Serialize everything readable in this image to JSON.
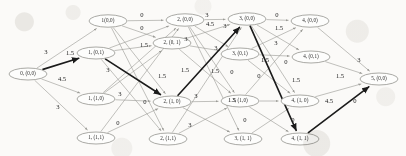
{
  "figure": {
    "kind": "layered-trellis-graph",
    "colors": {
      "background": "#fbfaf8",
      "node_fill": "#fdfdfc",
      "node_stroke": "#8d8d88",
      "edge": "#9a9a95",
      "highlight_edge": "#1b1b1b",
      "label_text": "#2b2b2b",
      "weight_text": "#242424"
    },
    "weight_values": [
      "0",
      "1.5",
      "3",
      "4.5"
    ]
  },
  "nodes": [
    {
      "id": "n0",
      "label": "0, (0,0)",
      "x": 28,
      "y": 74,
      "rx": 19,
      "ry": 6.0,
      "stage": 0,
      "state": "(0,0)"
    },
    {
      "id": "n1a",
      "label": "1(0,0)",
      "x": 108,
      "y": 21,
      "rx": 19,
      "ry": 6.2,
      "stage": 1,
      "state": "(0,0)"
    },
    {
      "id": "n1b",
      "label": "1, (0,1)",
      "x": 96,
      "y": 53,
      "rx": 19,
      "ry": 6.0,
      "stage": 1,
      "state": "(0,1)"
    },
    {
      "id": "n1c",
      "label": "1, (1,0)",
      "x": 96,
      "y": 99,
      "rx": 19,
      "ry": 6.0,
      "stage": 1,
      "state": "(1,0)"
    },
    {
      "id": "n1d",
      "label": "1, (1,1)",
      "x": 96,
      "y": 138,
      "rx": 19,
      "ry": 6.0,
      "stage": 1,
      "state": "(1,1)"
    },
    {
      "id": "n2a",
      "label": "2, (0,0)",
      "x": 185,
      "y": 20,
      "rx": 19,
      "ry": 6.2,
      "stage": 2,
      "state": "(0,0)"
    },
    {
      "id": "n2b",
      "label": "2, (0, 1)",
      "x": 172,
      "y": 43,
      "rx": 19,
      "ry": 6.0,
      "stage": 2,
      "state": "(0,1)"
    },
    {
      "id": "n2c",
      "label": "2, (1, 0)",
      "x": 172,
      "y": 102,
      "rx": 19,
      "ry": 6.0,
      "stage": 2,
      "state": "(1,0)"
    },
    {
      "id": "n2d",
      "label": "2, (1,1)",
      "x": 168,
      "y": 139,
      "rx": 19,
      "ry": 6.0,
      "stage": 2,
      "state": "(1,1)"
    },
    {
      "id": "n3a",
      "label": "3, (0,0)",
      "x": 247,
      "y": 19,
      "rx": 19,
      "ry": 6.2,
      "stage": 3,
      "state": "(0,0)"
    },
    {
      "id": "n3b",
      "label": "3, (0,1)",
      "x": 240,
      "y": 54,
      "rx": 19,
      "ry": 6.0,
      "stage": 3,
      "state": "(0,1)"
    },
    {
      "id": "n3c",
      "label": "3, (1,0)",
      "x": 240,
      "y": 101,
      "rx": 19,
      "ry": 6.0,
      "stage": 3,
      "state": "(1,0)"
    },
    {
      "id": "n3d",
      "label": "3, (1, 1)",
      "x": 243,
      "y": 139,
      "rx": 19,
      "ry": 6.0,
      "stage": 3,
      "state": "(1,1)"
    },
    {
      "id": "n4a",
      "label": "4, (0,0)",
      "x": 310,
      "y": 21,
      "rx": 19,
      "ry": 6.2,
      "stage": 4,
      "state": "(0,0)"
    },
    {
      "id": "n4b",
      "label": "4, (0,1)",
      "x": 311,
      "y": 57,
      "rx": 19,
      "ry": 6.0,
      "stage": 4,
      "state": "(0,1)"
    },
    {
      "id": "n4c",
      "label": "4, (1, 0)",
      "x": 300,
      "y": 101,
      "rx": 19,
      "ry": 6.0,
      "stage": 4,
      "state": "(1,0)"
    },
    {
      "id": "n4d",
      "label": "4, (1, 1)",
      "x": 300,
      "y": 139,
      "rx": 19,
      "ry": 6.0,
      "stage": 4,
      "state": "(1,1)"
    },
    {
      "id": "n5",
      "label": "5, (0,0)",
      "x": 379,
      "y": 79,
      "rx": 19,
      "ry": 6.0,
      "stage": 5,
      "state": "(0,0)"
    }
  ],
  "edges": [
    {
      "from": "n0",
      "to": "n1a",
      "weight": "3",
      "highlight": false
    },
    {
      "from": "n0",
      "to": "n1b",
      "weight": "1.5",
      "highlight": true
    },
    {
      "from": "n0",
      "to": "n1c",
      "weight": "4.5",
      "highlight": false
    },
    {
      "from": "n0",
      "to": "n1d",
      "weight": "3",
      "highlight": false
    },
    {
      "from": "n1a",
      "to": "n2a",
      "weight": "0",
      "highlight": false
    },
    {
      "from": "n1a",
      "to": "n2b",
      "weight": "1.5",
      "highlight": false
    },
    {
      "from": "n1a",
      "to": "n2c",
      "weight": "1.5",
      "highlight": false
    },
    {
      "from": "n1a",
      "to": "n2d",
      "weight": "3",
      "highlight": false
    },
    {
      "from": "n1b",
      "to": "n2a",
      "weight": "0",
      "highlight": false
    },
    {
      "from": "n1b",
      "to": "n2b",
      "weight": "3",
      "highlight": false
    },
    {
      "from": "n1b",
      "to": "n2c",
      "weight": "1.5",
      "highlight": true
    },
    {
      "from": "n1b",
      "to": "n2d",
      "weight": "3",
      "highlight": false
    },
    {
      "from": "n1c",
      "to": "n2a",
      "weight": "3",
      "highlight": false
    },
    {
      "from": "n1c",
      "to": "n2c",
      "weight": "0",
      "highlight": false
    },
    {
      "from": "n1c",
      "to": "n2b",
      "weight": "3",
      "highlight": false
    },
    {
      "from": "n1d",
      "to": "n2c",
      "weight": "0",
      "highlight": false
    },
    {
      "from": "n1d",
      "to": "n2a",
      "weight": "3",
      "highlight": false
    },
    {
      "from": "n2a",
      "to": "n3a",
      "weight": "3",
      "highlight": false
    },
    {
      "from": "n2a",
      "to": "n3b",
      "weight": "4.5",
      "highlight": false
    },
    {
      "from": "n2a",
      "to": "n3c",
      "weight": "3",
      "highlight": false
    },
    {
      "from": "n2a",
      "to": "n3d",
      "weight": "1.5",
      "highlight": false
    },
    {
      "from": "n2b",
      "to": "n3a",
      "weight": "3",
      "highlight": false
    },
    {
      "from": "n2b",
      "to": "n3c",
      "weight": "1.5",
      "highlight": false
    },
    {
      "from": "n2b",
      "to": "n3b",
      "weight": "1.5",
      "highlight": false
    },
    {
      "from": "n2c",
      "to": "n3a",
      "weight": "1.5",
      "highlight": true
    },
    {
      "from": "n2c",
      "to": "n3c",
      "weight": "0",
      "highlight": false
    },
    {
      "from": "n2c",
      "to": "n3d",
      "weight": "3",
      "highlight": false
    },
    {
      "from": "n2d",
      "to": "n3c",
      "weight": "3",
      "highlight": false
    },
    {
      "from": "n2d",
      "to": "n3a",
      "weight": "1.5",
      "highlight": false
    },
    {
      "from": "n3a",
      "to": "n4a",
      "weight": "0",
      "highlight": false
    },
    {
      "from": "n3a",
      "to": "n4b",
      "weight": "1.5",
      "highlight": false
    },
    {
      "from": "n3a",
      "to": "n4c",
      "weight": "1.5",
      "highlight": false
    },
    {
      "from": "n3a",
      "to": "n4d",
      "weight": "0",
      "highlight": true
    },
    {
      "from": "n3b",
      "to": "n4a",
      "weight": "3",
      "highlight": false
    },
    {
      "from": "n3b",
      "to": "n4b",
      "weight": "0",
      "highlight": false
    },
    {
      "from": "n3b",
      "to": "n4c",
      "weight": "1.5",
      "highlight": false
    },
    {
      "from": "n3c",
      "to": "n4a",
      "weight": "1.5",
      "highlight": false
    },
    {
      "from": "n3c",
      "to": "n4c",
      "weight": "0",
      "highlight": false
    },
    {
      "from": "n3c",
      "to": "n4d",
      "weight": "0",
      "highlight": false
    },
    {
      "from": "n3d",
      "to": "n4c",
      "weight": "0",
      "highlight": false
    },
    {
      "from": "n4a",
      "to": "n5",
      "weight": "3",
      "highlight": false
    },
    {
      "from": "n4b",
      "to": "n5",
      "weight": "1.5",
      "highlight": false
    },
    {
      "from": "n4c",
      "to": "n5",
      "weight": "4.5",
      "highlight": false
    },
    {
      "from": "n4d",
      "to": "n5",
      "weight": "0",
      "highlight": true
    }
  ],
  "weight_labels": [
    {
      "text": "3",
      "x": 46,
      "y": 52
    },
    {
      "text": "1.5",
      "x": 70,
      "y": 53
    },
    {
      "text": "4.5",
      "x": 62,
      "y": 79
    },
    {
      "text": "3",
      "x": 58,
      "y": 107
    },
    {
      "text": "0",
      "x": 142,
      "y": 15
    },
    {
      "text": "0",
      "x": 142,
      "y": 28
    },
    {
      "text": "1.5",
      "x": 144,
      "y": 45
    },
    {
      "text": "1.5",
      "x": 162,
      "y": 76
    },
    {
      "text": "3",
      "x": 186,
      "y": 39
    },
    {
      "text": "1.5",
      "x": 185,
      "y": 70
    },
    {
      "text": "3",
      "x": 108,
      "y": 70
    },
    {
      "text": "3",
      "x": 120,
      "y": 94
    },
    {
      "text": "0",
      "x": 145,
      "y": 102
    },
    {
      "text": "0",
      "x": 118,
      "y": 123
    },
    {
      "text": "3",
      "x": 190,
      "y": 125
    },
    {
      "text": "3",
      "x": 196,
      "y": 96
    },
    {
      "text": "3",
      "x": 207,
      "y": 15
    },
    {
      "text": "4.5",
      "x": 210,
      "y": 24
    },
    {
      "text": "3",
      "x": 225,
      "y": 26
    },
    {
      "text": "3",
      "x": 216,
      "y": 48
    },
    {
      "text": "1.5",
      "x": 215,
      "y": 71
    },
    {
      "text": "0",
      "x": 232,
      "y": 72
    },
    {
      "text": "1.5",
      "x": 232,
      "y": 100
    },
    {
      "text": "0",
      "x": 277,
      "y": 15
    },
    {
      "text": "1.5",
      "x": 279,
      "y": 28
    },
    {
      "text": "3",
      "x": 276,
      "y": 43
    },
    {
      "text": "1.5",
      "x": 265,
      "y": 60
    },
    {
      "text": "0",
      "x": 259,
      "y": 76
    },
    {
      "text": "0",
      "x": 286,
      "y": 62
    },
    {
      "text": "1.5",
      "x": 296,
      "y": 80
    },
    {
      "text": "1.5",
      "x": 340,
      "y": 76
    },
    {
      "text": "3",
      "x": 359,
      "y": 60
    },
    {
      "text": "4.5",
      "x": 329,
      "y": 101
    },
    {
      "text": "0",
      "x": 355,
      "y": 101
    },
    {
      "text": "0",
      "x": 293,
      "y": 120
    },
    {
      "text": "0",
      "x": 245,
      "y": 120
    }
  ]
}
